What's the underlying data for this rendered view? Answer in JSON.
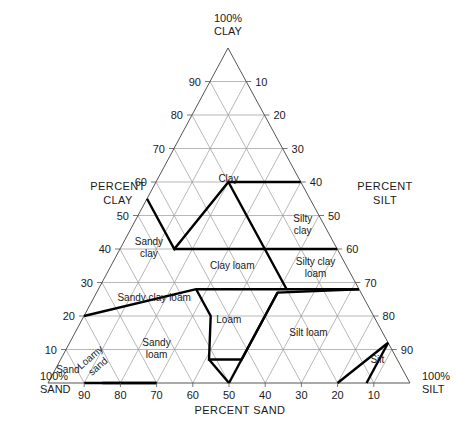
{
  "chart_data": {
    "type": "ternary",
    "axes": {
      "bottom": {
        "title": "PERCENT SAND",
        "corner_label": "100%\nSAND",
        "component": "sand"
      },
      "left": {
        "title": "PERCENT\nCLAY",
        "corner_label": "100%\nCLAY",
        "component": "clay"
      },
      "right": {
        "title": "PERCENT\nSILT",
        "corner_label": "100%\nSILT",
        "component": "silt"
      }
    },
    "tick_values": [
      10,
      20,
      30,
      40,
      50,
      60,
      70,
      80,
      90
    ],
    "grid": true,
    "grid_interval": 10,
    "regions": [
      {
        "name": "Clay",
        "label": "Clay",
        "label_pos": {
          "sand": 20,
          "silt": 20,
          "clay": 60
        },
        "vertices": [
          [
            0,
            40,
            60
          ],
          [
            20,
            20,
            60
          ],
          [
            45,
            15,
            40
          ],
          [
            45,
            0,
            55
          ],
          [
            0,
            0,
            100
          ]
        ]
      },
      {
        "name": "Silty clay",
        "label": "Silty clay",
        "label_pos": {
          "sand": 6,
          "silt": 47,
          "clay": 47
        },
        "vertices": [
          [
            0,
            40,
            60
          ],
          [
            0,
            60,
            40
          ],
          [
            20,
            40,
            40
          ]
        ]
      },
      {
        "name": "Silty clay loam",
        "label": "Silty clay loam",
        "label_pos": {
          "sand": 9,
          "silt": 57,
          "clay": 34
        },
        "vertices": [
          [
            0,
            60,
            40
          ],
          [
            0,
            72,
            28
          ],
          [
            20,
            52,
            28
          ],
          [
            20,
            40,
            40
          ]
        ]
      },
      {
        "name": "Sandy clay",
        "label": "Sandy clay",
        "label_pos": {
          "sand": 52,
          "silt": 8,
          "clay": 40
        },
        "vertices": [
          [
            45,
            15,
            40
          ],
          [
            65,
            0,
            35
          ],
          [
            45,
            0,
            55
          ]
        ]
      },
      {
        "name": "Clay loam",
        "label": "Clay loam",
        "label_pos": {
          "sand": 32,
          "silt": 34,
          "clay": 34
        },
        "vertices": [
          [
            20,
            40,
            40
          ],
          [
            20,
            52,
            28
          ],
          [
            45,
            27,
            28
          ],
          [
            45,
            15,
            40
          ]
        ]
      },
      {
        "name": "Sandy clay loam",
        "label": "Sandy clay loam",
        "label_pos": {
          "sand": 60,
          "silt": 15,
          "clay": 28
        },
        "vertices": [
          [
            45,
            27,
            28
          ],
          [
            80,
            0,
            20
          ],
          [
            65,
            0,
            35
          ],
          [
            45,
            15,
            40
          ]
        ]
      },
      {
        "name": "Loam",
        "label": "Loam",
        "label_pos": {
          "sand": 41,
          "silt": 41,
          "clay": 18
        },
        "vertices": [
          [
            45,
            27,
            28
          ],
          [
            45,
            35,
            20
          ],
          [
            52,
            41,
            7
          ],
          [
            52,
            41,
            7
          ],
          [
            43,
            50,
            7
          ],
          [
            23,
            50,
            27
          ]
        ]
      },
      {
        "name": "Silt loam",
        "label": "Silt loam",
        "label_pos": {
          "sand": 21,
          "silt": 65,
          "clay": 14
        },
        "vertices": [
          [
            0,
            72,
            28
          ],
          [
            0,
            88,
            12
          ],
          [
            20,
            80,
            0
          ],
          [
            50,
            50,
            0
          ],
          [
            23,
            50,
            27
          ]
        ]
      },
      {
        "name": "Silt",
        "label": "Silt",
        "label_pos": {
          "sand": 6,
          "silt": 88,
          "clay": 6
        },
        "vertices": [
          [
            0,
            88,
            12
          ],
          [
            0,
            100,
            0
          ],
          [
            20,
            80,
            0
          ]
        ]
      },
      {
        "name": "Sandy loam",
        "label": "Sandy loam",
        "label_pos": {
          "sand": 65,
          "silt": 25,
          "clay": 10
        },
        "vertices": [
          [
            80,
            0,
            20
          ],
          [
            52,
            41,
            7
          ],
          [
            43,
            50,
            7
          ],
          [
            50,
            50,
            0
          ],
          [
            85,
            15,
            0
          ]
        ]
      },
      {
        "name": "Loamy sand",
        "label": "Loamy sand",
        "label_pos": {
          "sand": 84,
          "silt": 10,
          "clay": 6
        },
        "vertices": [
          [
            85,
            15,
            0
          ],
          [
            90,
            10,
            0
          ],
          [
            70,
            30,
            0
          ]
        ]
      },
      {
        "name": "Sand",
        "label": "Sand",
        "label_pos": {
          "sand": 93,
          "silt": 4,
          "clay": 3
        },
        "vertices": [
          [
            90,
            10,
            0
          ],
          [
            100,
            0,
            0
          ],
          [
            70,
            30,
            0
          ]
        ]
      }
    ],
    "boundaries": [
      [
        [
          0,
          40,
          60
        ],
        [
          20,
          20,
          60
        ],
        [
          45,
          15,
          40
        ],
        [
          45,
          0,
          55
        ]
      ],
      [
        [
          0,
          60,
          40
        ],
        [
          20,
          40,
          40
        ],
        [
          45,
          15,
          40
        ]
      ],
      [
        [
          0,
          72,
          28
        ],
        [
          20,
          52,
          28
        ],
        [
          45,
          27,
          28
        ],
        [
          80,
          0,
          20
        ]
      ],
      [
        [
          20,
          52,
          28
        ],
        [
          20,
          40,
          40
        ],
        [
          20,
          20,
          60
        ]
      ],
      [
        [
          45,
          27,
          28
        ],
        [
          45,
          35,
          20
        ],
        [
          52,
          41,
          7
        ],
        [
          43,
          50,
          7
        ],
        [
          23,
          50,
          27
        ],
        [
          0,
          72,
          28
        ]
      ],
      [
        [
          52,
          41,
          7
        ],
        [
          50,
          50,
          0
        ]
      ],
      [
        [
          23,
          50,
          27
        ],
        [
          50,
          50,
          0
        ]
      ],
      [
        [
          0,
          88,
          12
        ],
        [
          20,
          80,
          0
        ]
      ],
      [
        [
          0,
          88,
          12
        ],
        [
          12,
          88,
          0
        ]
      ],
      [
        [
          85,
          15,
          0
        ],
        [
          70,
          30,
          0
        ]
      ],
      [
        [
          90,
          10,
          0
        ],
        [
          70,
          30,
          0
        ]
      ]
    ]
  }
}
